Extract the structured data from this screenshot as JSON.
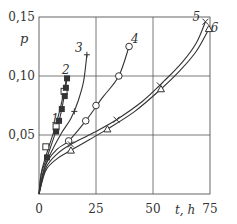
{
  "chart_data": {
    "type": "line",
    "title": "",
    "xlabel": "t, h",
    "ylabel": "p",
    "xlim": [
      0,
      75
    ],
    "ylim": [
      0,
      0.15
    ],
    "grid": true,
    "x_ticks": [
      {
        "value": 0,
        "label": "0"
      },
      {
        "value": 25,
        "label": "25"
      },
      {
        "value": 50,
        "label": "50"
      },
      {
        "value": 75,
        "label": "75"
      }
    ],
    "y_ticks": [
      {
        "value": 0.05,
        "label": "0,05"
      },
      {
        "value": 0.1,
        "label": "0,10"
      },
      {
        "value": 0.15,
        "label": "0,15"
      }
    ],
    "series": [
      {
        "name": "1",
        "marker": "open-square",
        "points": [
          [
            3.0,
            0.04
          ],
          [
            7.5,
            0.057
          ],
          [
            11.0,
            0.087
          ]
        ],
        "curve": [
          [
            0,
            0
          ],
          [
            1,
            0.018
          ],
          [
            3,
            0.032
          ],
          [
            5,
            0.044
          ],
          [
            7,
            0.056
          ],
          [
            9,
            0.07
          ],
          [
            11,
            0.087
          ],
          [
            12,
            0.098
          ]
        ],
        "label_pos": [
          7,
          0.06
        ]
      },
      {
        "name": "2",
        "marker": "filled-square",
        "points": [
          [
            3.5,
            0.031
          ],
          [
            7.5,
            0.053
          ],
          [
            8.8,
            0.062
          ],
          [
            10.0,
            0.072
          ],
          [
            11.3,
            0.083
          ],
          [
            11.8,
            0.09
          ],
          [
            12.3,
            0.098
          ]
        ],
        "curve": [
          [
            0,
            0
          ],
          [
            1,
            0.017
          ],
          [
            3.5,
            0.031
          ],
          [
            6,
            0.045
          ],
          [
            8.8,
            0.062
          ],
          [
            10.5,
            0.077
          ],
          [
            12.3,
            0.098
          ]
        ],
        "label_pos": [
          11.8,
          0.102
        ]
      },
      {
        "name": "3",
        "marker": "plus",
        "points": [
          [
            15.5,
            0.07
          ],
          [
            21.0,
            0.118
          ]
        ],
        "curve": [
          [
            0,
            0
          ],
          [
            2,
            0.02
          ],
          [
            6,
            0.038
          ],
          [
            10,
            0.052
          ],
          [
            14,
            0.064
          ],
          [
            17,
            0.078
          ],
          [
            19.5,
            0.095
          ],
          [
            21,
            0.118
          ]
        ],
        "label_pos": [
          17.5,
          0.12
        ]
      },
      {
        "name": "4",
        "marker": "open-circle",
        "points": [
          [
            13.0,
            0.045
          ],
          [
            20.5,
            0.062
          ],
          [
            25.0,
            0.075
          ],
          [
            35.0,
            0.1
          ],
          [
            39.5,
            0.125
          ]
        ],
        "curve": [
          [
            0,
            0
          ],
          [
            3,
            0.025
          ],
          [
            8,
            0.038
          ],
          [
            13,
            0.045
          ],
          [
            20.5,
            0.062
          ],
          [
            28,
            0.082
          ],
          [
            35,
            0.1
          ],
          [
            39.5,
            0.125
          ]
        ],
        "label_pos": [
          42,
          0.128
        ]
      },
      {
        "name": "5",
        "marker": "cross",
        "points": [
          [
            14.0,
            0.042
          ],
          [
            34.0,
            0.063
          ],
          [
            53.0,
            0.092
          ],
          [
            73.0,
            0.146
          ]
        ],
        "curve": [
          [
            0,
            0
          ],
          [
            3,
            0.022
          ],
          [
            8,
            0.034
          ],
          [
            14,
            0.042
          ],
          [
            24,
            0.052
          ],
          [
            34,
            0.063
          ],
          [
            45,
            0.078
          ],
          [
            55,
            0.096
          ],
          [
            63,
            0.112
          ],
          [
            69,
            0.128
          ],
          [
            73,
            0.146
          ]
        ],
        "label_pos": [
          69,
          0.147
        ]
      },
      {
        "name": "6",
        "marker": "open-triangle",
        "points": [
          [
            14.0,
            0.037
          ],
          [
            30.0,
            0.055
          ],
          [
            53.5,
            0.089
          ],
          [
            74.5,
            0.14
          ]
        ],
        "curve": [
          [
            0,
            0
          ],
          [
            3,
            0.02
          ],
          [
            8,
            0.03
          ],
          [
            14,
            0.037
          ],
          [
            22,
            0.046
          ],
          [
            30,
            0.055
          ],
          [
            42,
            0.07
          ],
          [
            53.5,
            0.089
          ],
          [
            62,
            0.105
          ],
          [
            69,
            0.121
          ],
          [
            74.5,
            0.14
          ]
        ],
        "label_pos": [
          77,
          0.137
        ]
      }
    ]
  },
  "colors": {
    "line": "#333333",
    "grid": "#555555",
    "background": "#ffffff",
    "text": "#333333"
  }
}
